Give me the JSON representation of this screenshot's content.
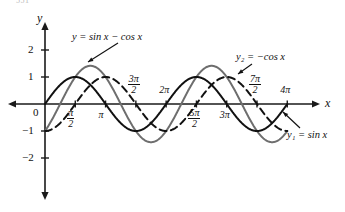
{
  "figure": {
    "corner_text": "551",
    "axes": {
      "y_axis_label": "y",
      "x_axis_label": "x",
      "origin_label": "0"
    },
    "y_ticks": [
      {
        "label": "2",
        "value": 2
      },
      {
        "label": "1",
        "value": 1
      },
      {
        "label": "−1",
        "value": -1
      },
      {
        "label": "−2",
        "value": -2
      }
    ],
    "x_ticks": [
      {
        "num": "π",
        "den": "2",
        "fraction": true,
        "value": 1.5707963,
        "side": "below"
      },
      {
        "label": "π",
        "fraction": false,
        "value": 3.1415927,
        "side": "below"
      },
      {
        "num": "3π",
        "den": "2",
        "fraction": true,
        "value": 4.712389,
        "side": "above"
      },
      {
        "label": "2π",
        "fraction": false,
        "value": 6.2831853,
        "side": "above"
      },
      {
        "num": "5π",
        "den": "2",
        "fraction": true,
        "value": 7.8539816,
        "side": "below"
      },
      {
        "label": "3π",
        "fraction": false,
        "value": 9.424778,
        "side": "below"
      },
      {
        "num": "7π",
        "den": "2",
        "fraction": true,
        "value": 10.9955743,
        "side": "above"
      },
      {
        "label": "4π",
        "fraction": false,
        "value": 12.5663706,
        "side": "above"
      }
    ],
    "annotations": [
      {
        "id": "sum-curve-label",
        "text": "y = sin x − cos x"
      },
      {
        "id": "y2-curve-label",
        "text": "y₂ = −cos x"
      },
      {
        "id": "y1-curve-label",
        "text": "y₁ = sin x"
      }
    ],
    "colors": {
      "axis": "#1a1a1a",
      "sum_curve": "#6e6e6e",
      "sine_curve": "#111111",
      "neg_cosine_curve": "#111111",
      "text": "#111111"
    }
  },
  "chart_data": {
    "type": "line",
    "title": "",
    "xlabel": "x",
    "ylabel": "y",
    "xlim": [
      -0.55,
      13.2
    ],
    "ylim": [
      -2.6,
      2.45
    ],
    "grid": false,
    "legend": "inline-annotations",
    "x_tick_values": [
      1.5707963,
      3.1415927,
      4.712389,
      6.2831853,
      7.8539816,
      9.424778,
      10.9955743,
      12.5663706
    ],
    "x_tick_labels": [
      "π/2",
      "π",
      "3π/2",
      "2π",
      "5π/2",
      "3π",
      "7π/2",
      "4π"
    ],
    "y_tick_values": [
      2,
      1,
      -1,
      -2
    ],
    "y_tick_labels": [
      "2",
      "1",
      "−1",
      "−2"
    ],
    "domain": [
      0,
      12.5663706
    ],
    "series": [
      {
        "name": "y = sin x − cos x",
        "formula": "sin(x) - cos(x)",
        "style": "solid",
        "color": "#6e6e6e",
        "amplitude": 1.414,
        "period": 6.2831853,
        "zeros": [
          0.785398,
          3.926991,
          7.068583,
          10.210176
        ],
        "maxima_x": [
          2.356194,
          8.63938
        ],
        "minima_x": [
          5.497787,
          11.780972
        ],
        "y_at_0": -1
      },
      {
        "name": "y₁ = sin x",
        "formula": "sin(x)",
        "style": "solid",
        "color": "#111111",
        "amplitude": 1,
        "period": 6.2831853,
        "zeros": [
          0,
          3.1415927,
          6.2831853,
          9.424778,
          12.5663706
        ],
        "maxima_x": [
          1.5707963,
          7.8539816
        ],
        "minima_x": [
          4.712389,
          10.9955743
        ],
        "y_at_0": 0
      },
      {
        "name": "y₂ = −cos x",
        "formula": "-cos(x)",
        "style": "dashed",
        "color": "#111111",
        "amplitude": 1,
        "period": 6.2831853,
        "zeros": [
          1.5707963,
          4.712389,
          7.8539816,
          10.9955743
        ],
        "maxima_x": [
          3.1415927,
          9.424778
        ],
        "minima_x": [
          0,
          6.2831853,
          12.5663706
        ],
        "y_at_0": -1
      }
    ]
  }
}
